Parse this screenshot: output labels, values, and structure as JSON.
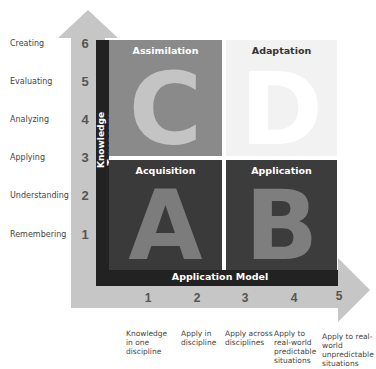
{
  "colors": {
    "arrow": "#c6c6c6",
    "dark_bar": "#222222",
    "quad_c": "#8a8a8a",
    "quad_d": "#f2f2f2",
    "quad_a": "#3a3a3a",
    "quad_b": "#3c3c3c",
    "letter_c": "#c4c4c4",
    "letter_d": "#ffffff",
    "letter_a": "#7c7c7c",
    "letter_b": "#7e7e7e"
  },
  "y_axis": {
    "title": "Knowledge Taxonomy",
    "levels": [
      {
        "num": "6",
        "label": "Creating"
      },
      {
        "num": "5",
        "label": "Evaluating"
      },
      {
        "num": "4",
        "label": "Analyzing"
      },
      {
        "num": "3",
        "label": "Applying"
      },
      {
        "num": "2",
        "label": "Understanding"
      },
      {
        "num": "1",
        "label": "Remembering"
      }
    ]
  },
  "x_axis": {
    "title": "Application Model",
    "levels": [
      {
        "num": "1",
        "label": "Knowledge in one discipline"
      },
      {
        "num": "2",
        "label": "Apply in discipline"
      },
      {
        "num": "3",
        "label": "Apply across disciplines"
      },
      {
        "num": "4",
        "label": "Apply to real-world predictable situations"
      },
      {
        "num": "5",
        "label": "Apply to real-world unpredictable situations"
      }
    ]
  },
  "quadrants": {
    "c": {
      "title": "Assimilation",
      "letter": "C"
    },
    "d": {
      "title": "Adaptation",
      "letter": "D"
    },
    "a": {
      "title": "Acquisition",
      "letter": "A"
    },
    "b": {
      "title": "Application",
      "letter": "B"
    }
  }
}
